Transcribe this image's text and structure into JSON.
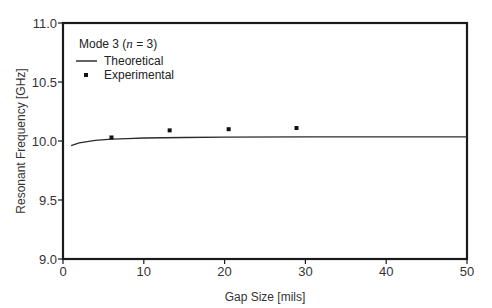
{
  "chart_data": {
    "type": "line",
    "title": "",
    "xlabel": "Gap Size [mils]",
    "ylabel": "Resonant Frequency [GHz]",
    "xlim": [
      0,
      50
    ],
    "ylim": [
      9.0,
      11.0
    ],
    "xticks": [
      0,
      10,
      20,
      30,
      40,
      50
    ],
    "yticks": [
      9.0,
      9.5,
      10.0,
      10.5,
      11.0
    ],
    "xtick_labels": [
      "0",
      "10",
      "20",
      "30",
      "40",
      "50"
    ],
    "ytick_labels": [
      "9.0",
      "9.5",
      "10.0",
      "10.5",
      "11.0"
    ],
    "grid": false,
    "legend_position": "upper left",
    "legend_title": "Mode 3 (n = 3)",
    "series": [
      {
        "name": "Theoretical",
        "style": "line",
        "x": [
          1.0,
          2.0,
          3.0,
          4.0,
          6.0,
          8.0,
          10.0,
          15.0,
          20.0,
          30.0,
          40.0,
          50.0
        ],
        "y": [
          9.96,
          9.985,
          9.995,
          10.005,
          10.015,
          10.02,
          10.025,
          10.03,
          10.033,
          10.035,
          10.035,
          10.035
        ]
      },
      {
        "name": "Experimental",
        "style": "marker",
        "x": [
          6.0,
          13.2,
          20.5,
          28.9
        ],
        "y": [
          10.03,
          10.09,
          10.1,
          10.11
        ]
      }
    ]
  },
  "legend": {
    "title_prefix": "Mode 3 (",
    "title_var": "n",
    "title_suffix": " = 3)",
    "items": [
      {
        "label": "Theoretical",
        "symbol": "line"
      },
      {
        "label": "Experimental",
        "symbol": "square"
      }
    ]
  },
  "axes": {
    "xlabel": "Gap Size [mils]",
    "ylabel": "Resonant Frequency [GHz]"
  },
  "colors": {
    "axis": "#1a1a1a",
    "line": "#2a2a2a",
    "marker": "#111111"
  }
}
